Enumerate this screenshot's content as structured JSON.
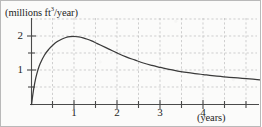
{
  "figure": {
    "background_color": "#fbfbfa",
    "border_color": "#b9b9b9",
    "ink_color": "#3a3a3a",
    "grid_color": "#bcbcbc"
  },
  "labels": {
    "y_axis_caption_prefix": "(millions ft",
    "y_axis_caption_exponent": "3",
    "y_axis_caption_suffix": "/year)",
    "x_axis_caption": "(years)"
  },
  "ticks": {
    "y": [
      {
        "value": 2,
        "label": "2"
      },
      {
        "value": 1,
        "label": "1"
      }
    ],
    "x": [
      {
        "value": 1,
        "label": "1"
      },
      {
        "value": 2,
        "label": "2"
      },
      {
        "value": 3,
        "label": "3"
      },
      {
        "value": 4,
        "label": "4"
      }
    ]
  },
  "chart_data": {
    "type": "line",
    "title": "",
    "subtitle": "",
    "xlabel": "(years)",
    "ylabel": "(millions ft3/year)",
    "xlim": [
      0,
      5.35
    ],
    "ylim": [
      0,
      2.25
    ],
    "xticks": [
      1,
      2,
      3,
      4
    ],
    "yticks": [
      1,
      2
    ],
    "minor_xticks": [
      0.5,
      1.5,
      2.5,
      3.5,
      4.5,
      5
    ],
    "minor_yticks": [
      0.5,
      1.5
    ],
    "grid": true,
    "grid_style": "dashed",
    "legend": null,
    "legend_position": "none",
    "annotations": [],
    "series": [
      {
        "name": "rate of production",
        "description": "rises steeply from origin, peaks at (1, 2), then decays slowly",
        "x": [
          0.0,
          0.05,
          0.1,
          0.15,
          0.2,
          0.3,
          0.4,
          0.5,
          0.6,
          0.7,
          0.8,
          0.9,
          1.0,
          1.1,
          1.2,
          1.3,
          1.4,
          1.5,
          1.6,
          1.8,
          2.0,
          2.2,
          2.4,
          2.6,
          2.8,
          3.0,
          3.2,
          3.4,
          3.6,
          3.8,
          4.0,
          4.2,
          4.4,
          4.6,
          4.8,
          5.0,
          5.2,
          5.35
        ],
        "y": [
          0.0,
          0.45,
          0.78,
          1.02,
          1.2,
          1.45,
          1.62,
          1.75,
          1.85,
          1.92,
          1.97,
          1.995,
          2.0,
          1.99,
          1.96,
          1.92,
          1.87,
          1.81,
          1.75,
          1.63,
          1.51,
          1.4,
          1.31,
          1.22,
          1.15,
          1.09,
          1.03,
          0.985,
          0.945,
          0.91,
          0.88,
          0.85,
          0.825,
          0.8,
          0.78,
          0.76,
          0.74,
          0.72
        ]
      }
    ]
  }
}
